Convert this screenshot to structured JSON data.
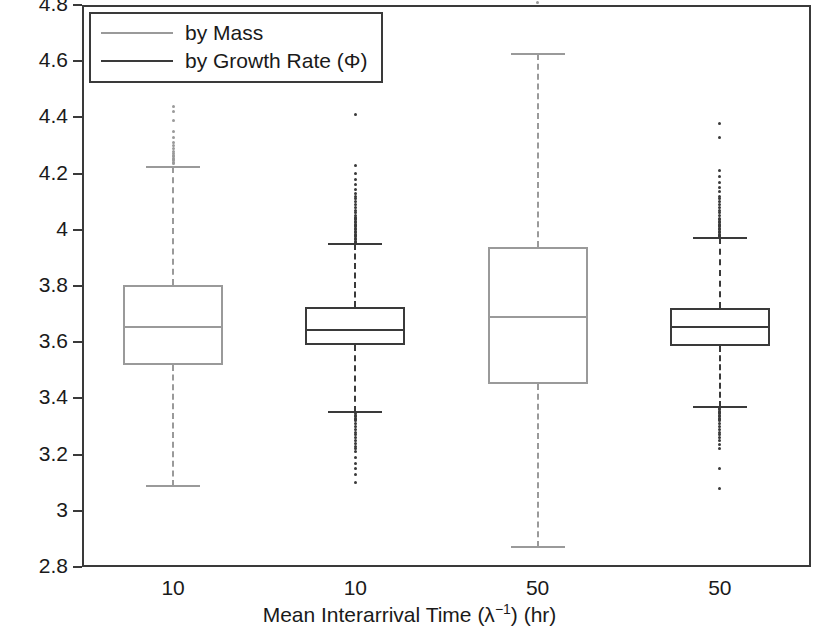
{
  "chart_data": {
    "type": "box",
    "title": "",
    "xlabel": "Mean Interarrival Time (λ⁻¹) (hr)",
    "xlabel_parts": {
      "pre": "Mean Interarrival Time (λ",
      "sup": "−1",
      "post": ") (hr)"
    },
    "ylabel": "Dominant Proliferation Commitment (η)",
    "ylim": [
      2.8,
      4.8
    ],
    "ytick_labels": [
      "4.8",
      "4.6",
      "4.4",
      "4.2",
      "4",
      "3.8",
      "3.6",
      "3.4",
      "3.2",
      "3",
      "2.8"
    ],
    "ytick_values": [
      4.8,
      4.6,
      4.4,
      4.2,
      4.0,
      3.8,
      3.6,
      3.4,
      3.2,
      3.0,
      2.8
    ],
    "categories": [
      "10",
      "10",
      "50",
      "50"
    ],
    "grid": false,
    "legend": {
      "position": "top-left",
      "entries": [
        {
          "label": "by Mass",
          "color": "#9a9a9a"
        },
        {
          "label": "by Growth Rate (Φ)",
          "color": "#3a3a3a"
        }
      ]
    },
    "boxes": [
      {
        "name": "by Mass",
        "category": "10",
        "color": "#9a9a9a",
        "q1": 3.52,
        "median": 3.655,
        "q3": 3.805,
        "whisker_low": 3.09,
        "whisker_high": 4.225,
        "outliers_high": [
          4.55,
          4.44,
          4.42,
          4.39,
          4.35,
          4.33,
          4.31,
          4.3,
          4.29,
          4.28,
          4.27,
          4.265,
          4.26,
          4.255,
          4.25,
          4.245,
          4.24,
          4.235
        ],
        "outliers_low": []
      },
      {
        "name": "by Growth Rate (Φ)",
        "category": "10",
        "color": "#3a3a3a",
        "q1": 3.59,
        "median": 3.645,
        "q3": 3.725,
        "whisker_low": 3.35,
        "whisker_high": 3.95,
        "outliers_high": [
          4.545,
          4.41,
          4.23,
          4.2,
          4.18,
          4.16,
          4.145,
          4.13,
          4.12,
          4.11,
          4.1,
          4.09,
          4.08,
          4.07,
          4.06,
          4.05,
          4.045,
          4.04,
          4.035,
          4.03,
          4.025,
          4.02,
          4.015,
          4.01,
          4.005,
          4.0,
          3.995,
          3.99,
          3.985,
          3.98,
          3.975,
          3.97,
          3.965,
          3.96,
          3.955
        ],
        "outliers_low": [
          3.345,
          3.34,
          3.335,
          3.33,
          3.325,
          3.32,
          3.31,
          3.3,
          3.29,
          3.28,
          3.27,
          3.26,
          3.25,
          3.24,
          3.23,
          3.22,
          3.21,
          3.19,
          3.17,
          3.15,
          3.13,
          3.1
        ]
      },
      {
        "name": "by Mass",
        "category": "50",
        "color": "#9a9a9a",
        "q1": 3.45,
        "median": 3.69,
        "q3": 3.94,
        "whisker_low": 2.87,
        "whisker_high": 4.625,
        "outliers_high": [
          4.81
        ],
        "outliers_low": []
      },
      {
        "name": "by Growth Rate (Φ)",
        "category": "50",
        "color": "#3a3a3a",
        "q1": 3.585,
        "median": 3.655,
        "q3": 3.72,
        "whisker_low": 3.37,
        "whisker_high": 3.97,
        "outliers_high": [
          4.38,
          4.33,
          4.21,
          4.19,
          4.17,
          4.15,
          4.135,
          4.12,
          4.11,
          4.1,
          4.09,
          4.08,
          4.07,
          4.06,
          4.05,
          4.04,
          4.035,
          4.03,
          4.025,
          4.02,
          4.015,
          4.01,
          4.005,
          4.0,
          3.995,
          3.99,
          3.985,
          3.98,
          3.975
        ],
        "outliers_low": [
          3.365,
          3.36,
          3.355,
          3.35,
          3.345,
          3.34,
          3.335,
          3.33,
          3.325,
          3.32,
          3.31,
          3.3,
          3.29,
          3.28,
          3.27,
          3.26,
          3.25,
          3.235,
          3.22,
          3.15,
          3.08
        ]
      }
    ]
  }
}
